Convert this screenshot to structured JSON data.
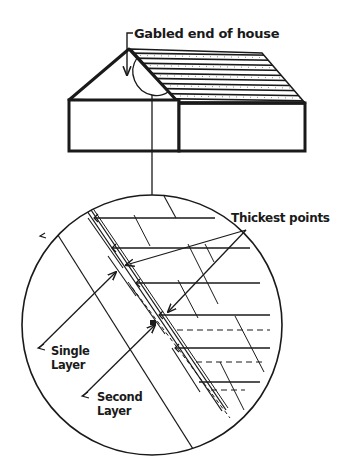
{
  "diagram": {
    "type": "roof-shingle-layers",
    "labels": {
      "gabled_end": "Gabled end of house",
      "thickest_points": "Thickest points",
      "single_layer_line1": "Single",
      "single_layer_line2": "Layer",
      "second_layer_line1": "Second",
      "second_layer_line2": "Layer"
    },
    "colors": {
      "ink": "#1a1a1a",
      "background": "#ffffff"
    }
  }
}
